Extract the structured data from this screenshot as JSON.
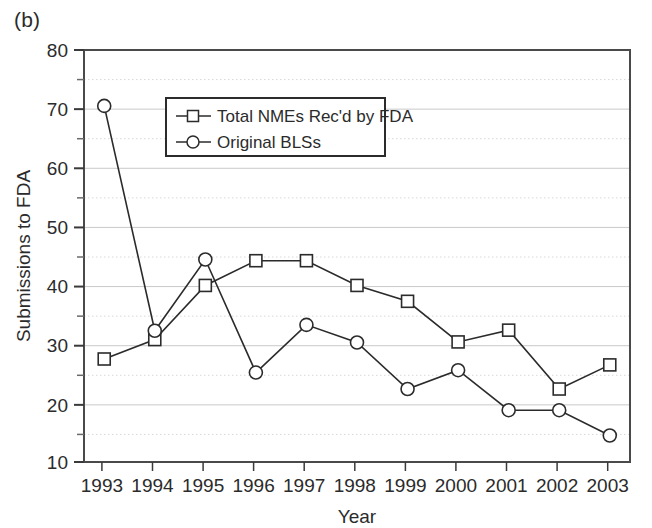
{
  "figure": {
    "panel_label": "(b)",
    "background_color": "#ffffff",
    "frame_color": "#4a4a4a",
    "gridline_color": "#c9c9c9",
    "series_color": "#2b2b2b"
  },
  "chart_data": {
    "type": "line",
    "title": "",
    "subtitle": "",
    "xlabel": "Year",
    "ylabel": "Submissions to FDA",
    "categories": [
      "1993",
      "1994",
      "1995",
      "1996",
      "1997",
      "1998",
      "1999",
      "2000",
      "2001",
      "2002",
      "2003"
    ],
    "x": [
      1993,
      1994,
      1995,
      1996,
      1997,
      1998,
      1999,
      2000,
      2001,
      2002,
      2003
    ],
    "series": [
      {
        "name": "Total NMEs Rec'd by FDA",
        "marker": "square",
        "values": [
          27.5,
          30.8,
          40.0,
          44.2,
          44.2,
          40.0,
          37.3,
          30.4,
          32.4,
          22.4,
          26.5
        ]
      },
      {
        "name": "Original BLSs",
        "marker": "circle",
        "values": [
          70.5,
          32.3,
          44.4,
          25.2,
          33.3,
          30.3,
          22.4,
          25.6,
          18.8,
          18.8,
          14.5
        ]
      }
    ],
    "ylim": [
      10,
      80
    ],
    "xlim": [
      1992.6,
      2003.4
    ],
    "ytick_labels": [
      "10",
      "20",
      "30",
      "40",
      "50",
      "60",
      "70",
      "80"
    ],
    "yticks": [
      10,
      20,
      30,
      40,
      50,
      60,
      70,
      80
    ],
    "yminor_ticks": [
      15,
      25,
      35,
      45,
      55,
      65,
      75
    ],
    "grid": "horizontal-major-and-minor",
    "legend_position": "upper-center-left",
    "legend_entries": [
      "Total NMEs Rec'd by FDA",
      "Original BLSs"
    ]
  },
  "legend": {
    "items": [
      {
        "label": "Total NMEs Rec'd by FDA",
        "marker": "square-marker-icon"
      },
      {
        "label": "Original BLSs",
        "marker": "circle-marker-icon"
      }
    ]
  }
}
